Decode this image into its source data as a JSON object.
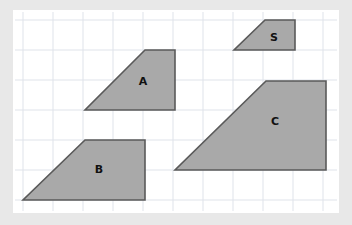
{
  "canvas": {
    "width": 352,
    "height": 225,
    "background_color": "#e8e8e8",
    "card": {
      "x": 13,
      "y": 10,
      "width": 326,
      "height": 203,
      "fill": "#ffffff"
    }
  },
  "grid": {
    "visible": true,
    "origin_x": 23,
    "origin_y": 20,
    "spacing": 30,
    "line_color": "#dfe3ea",
    "line_width": 1,
    "vertical_lines": [
      23,
      53,
      83,
      113,
      143,
      173,
      203,
      233,
      263,
      293,
      323
    ],
    "horizontal_lines": [
      20,
      50,
      80,
      110,
      140,
      170,
      200
    ],
    "extent": {
      "left": 15,
      "top": 12,
      "right": 337,
      "bottom": 211
    }
  },
  "style": {
    "shape_fill": "#a9a9a9",
    "shape_stroke": "#5a5a5a",
    "shape_stroke_width": 1.6,
    "label_color": "#111111",
    "label_font_size": 11
  },
  "shapes": [
    {
      "id": "shape-a",
      "label": "A",
      "type": "trapezoid",
      "points": "145,50 175,50 175,110 85,110",
      "label_x": 143,
      "label_y": 82
    },
    {
      "id": "shape-b",
      "label": "B",
      "type": "trapezoid",
      "points": "85,140 145,140 145,200 23,200",
      "label_x": 99,
      "label_y": 170
    },
    {
      "id": "shape-c",
      "label": "C",
      "type": "trapezoid",
      "points": "266,81 326,81 326,170 175,170",
      "label_x": 275,
      "label_y": 122
    },
    {
      "id": "shape-s",
      "label": "S",
      "type": "trapezoid",
      "points": "265,20 295,20 295,50 234,50",
      "label_x": 274,
      "label_y": 38
    }
  ]
}
